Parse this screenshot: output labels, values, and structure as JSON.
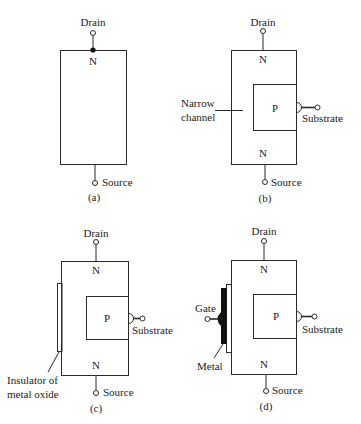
{
  "panels": [
    {
      "id": "a",
      "caption": "(a)",
      "drain_label": "Drain",
      "source_label": "Source",
      "regions": [
        "N"
      ]
    },
    {
      "id": "b",
      "caption": "(b)",
      "drain_label": "Drain",
      "source_label": "Source",
      "substrate_label": "Substrate",
      "channel_label_line1": "Narrow",
      "channel_label_line2": "channel",
      "regions": [
        "N",
        "P",
        "N"
      ]
    },
    {
      "id": "c",
      "caption": "(c)",
      "drain_label": "Drain",
      "source_label": "Source",
      "substrate_label": "Substrate",
      "insulator_label_line1": "Insulator of",
      "insulator_label_line2": "metal oxide",
      "regions": [
        "N",
        "P",
        "N"
      ]
    },
    {
      "id": "d",
      "caption": "(d)",
      "drain_label": "Drain",
      "source_label": "Source",
      "substrate_label": "Substrate",
      "gate_label": "Gate",
      "metal_label": "Metal",
      "regions": [
        "N",
        "P",
        "N"
      ]
    }
  ],
  "colors": {
    "line": "#2a2a2a",
    "metal": "#111111",
    "background": "#ffffff"
  }
}
